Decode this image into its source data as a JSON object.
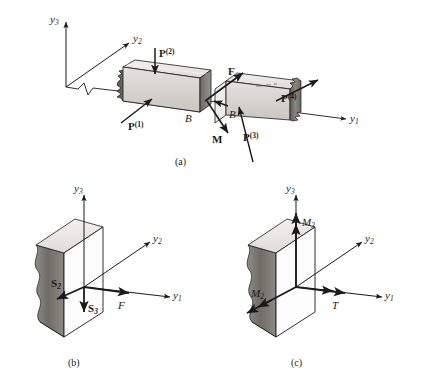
{
  "figure": {
    "type": "engineering-mechanics-free-body-diagram",
    "background_color": "#ffffff",
    "ink_color": "#1a1a1a",
    "panels": [
      {
        "id": "a",
        "caption": "(a)",
        "description": "beam cut at section B with external loads and internal resultants F and M"
      },
      {
        "id": "b",
        "caption": "(b)",
        "description": "force resultants on cut face: S2, S3, F"
      },
      {
        "id": "c",
        "caption": "(c)",
        "description": "moment resultants on cut face: M2, M3, T"
      }
    ]
  },
  "panel_a": {
    "caption": "(a)",
    "axes": [
      {
        "name": "y3",
        "base": "y",
        "sub": "3"
      },
      {
        "name": "y2",
        "base": "y",
        "sub": "2"
      },
      {
        "name": "y1",
        "base": "y",
        "sub": "1"
      }
    ],
    "loads": [
      {
        "name": "P1",
        "base": "P",
        "sup": "(1)"
      },
      {
        "name": "P2",
        "base": "P",
        "sup": "(2)"
      },
      {
        "name": "P3",
        "base": "P",
        "sup": "(3)"
      },
      {
        "name": "P4",
        "base": "P",
        "sup": "(4)"
      }
    ],
    "resultants": [
      {
        "name": "F",
        "base": "F"
      },
      {
        "name": "M",
        "base": "M"
      }
    ],
    "section_labels": [
      {
        "name": "B-left",
        "base": "B"
      },
      {
        "name": "B-right",
        "base": "B"
      }
    ]
  },
  "panel_b": {
    "caption": "(b)",
    "axes": [
      {
        "name": "y3",
        "base": "y",
        "sub": "3"
      },
      {
        "name": "y2",
        "base": "y",
        "sub": "2"
      },
      {
        "name": "y1",
        "base": "y",
        "sub": "1"
      }
    ],
    "vectors": [
      {
        "name": "S2",
        "base": "S",
        "sub": "2",
        "style": "bold",
        "direction": "down-left"
      },
      {
        "name": "S3",
        "base": "S",
        "sub": "3",
        "style": "bold",
        "direction": "down"
      },
      {
        "name": "F",
        "base": "F",
        "style": "italic",
        "direction": "right"
      }
    ]
  },
  "panel_c": {
    "caption": "(c)",
    "axes": [
      {
        "name": "y3",
        "base": "y",
        "sub": "3"
      },
      {
        "name": "y2",
        "base": "y",
        "sub": "2"
      },
      {
        "name": "y1",
        "base": "y",
        "sub": "1"
      }
    ],
    "vectors": [
      {
        "name": "M3",
        "base": "M",
        "sub": "3",
        "style": "italic",
        "direction": "up",
        "arrowheads": "double"
      },
      {
        "name": "M2",
        "base": "M",
        "sub": "2",
        "style": "italic",
        "direction": "down-left",
        "arrowheads": "double"
      },
      {
        "name": "T",
        "base": "T",
        "style": "italic",
        "direction": "right",
        "arrowheads": "double"
      }
    ]
  },
  "text": {
    "y": "y",
    "P": "P",
    "F": "F",
    "M": "M",
    "S": "S",
    "T": "T",
    "B": "B",
    "s1": "1",
    "s2": "2",
    "s3": "3",
    "p1": "(1)",
    "p2": "(2)",
    "p3": "(3)",
    "p4": "(4)",
    "cap_a": "(a)",
    "cap_b": "(b)",
    "cap_c": "(c)"
  }
}
